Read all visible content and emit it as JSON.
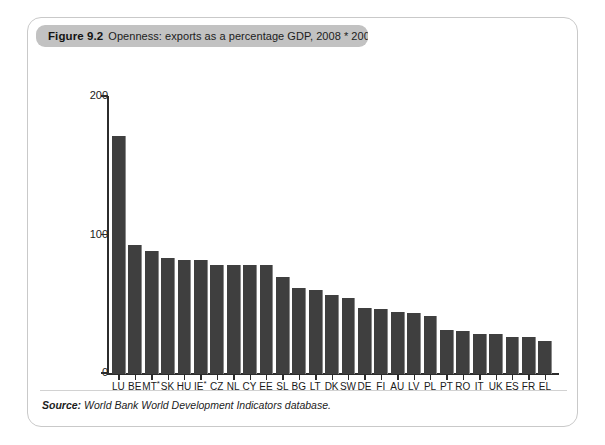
{
  "figure": {
    "number": "Figure 9.2",
    "title": "Openness: exports as a percentage GDP, 2008 * 2007",
    "source_label": "Source:",
    "source_text": "World Bank World Development Indicators database."
  },
  "chart_data": {
    "type": "bar",
    "title": "Openness: exports as a percentage GDP, 2008 * 2007",
    "xlabel": "",
    "ylabel": "",
    "ylim": [
      0,
      200
    ],
    "yticks": [
      0,
      100,
      200
    ],
    "grid": false,
    "legend": null,
    "categories": [
      "LU",
      "BE",
      "MT*",
      "SK",
      "HU",
      "IE*",
      "CZ",
      "NL",
      "CY",
      "EE",
      "SL",
      "BG",
      "LT",
      "DK",
      "SW",
      "DE",
      "FI",
      "AU",
      "LV",
      "PL",
      "PT",
      "RO",
      "IT",
      "UK",
      "ES",
      "FR",
      "EL"
    ],
    "values": [
      172,
      93,
      89,
      84,
      82,
      82,
      79,
      79,
      79,
      79,
      70,
      62,
      61,
      57,
      55,
      48,
      47,
      45,
      44,
      42,
      32,
      31,
      29,
      29,
      27,
      27,
      24
    ],
    "annotations": [
      "* indicates 2007 data for MT and IE"
    ]
  }
}
